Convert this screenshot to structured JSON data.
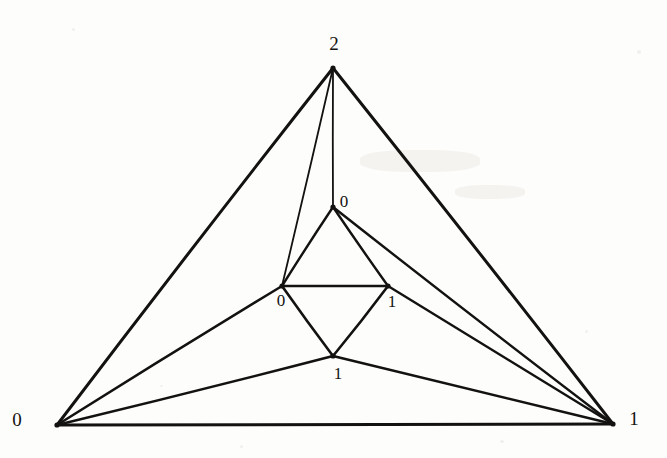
{
  "figure": {
    "type": "planar-graph-drawing",
    "background_color": "#fdfdfc",
    "ink_color": "#141210",
    "width": 667,
    "height": 458,
    "vertices": [
      {
        "id": "apex",
        "label": "2",
        "x": 333,
        "y": 68,
        "label_x": 334,
        "label_y": 43
      },
      {
        "id": "inner-top",
        "label": "0",
        "x": 333,
        "y": 207,
        "label_x": 344,
        "label_y": 201
      },
      {
        "id": "inner-left",
        "label": "0",
        "x": 282,
        "y": 286,
        "label_x": 281,
        "label_y": 300
      },
      {
        "id": "inner-right",
        "label": "1",
        "x": 388,
        "y": 286,
        "label_x": 392,
        "label_y": 301
      },
      {
        "id": "inner-bottom",
        "label": "1",
        "x": 333,
        "y": 356,
        "label_x": 338,
        "label_y": 373
      },
      {
        "id": "bottom-left",
        "label": "0",
        "x": 57,
        "y": 425,
        "label_x": 17,
        "label_y": 419
      },
      {
        "id": "bottom-right",
        "label": "1",
        "x": 613,
        "y": 424,
        "label_x": 634,
        "label_y": 418
      }
    ],
    "edges": [
      {
        "from": "bottom-left",
        "to": "apex",
        "weight": 3.0
      },
      {
        "from": "apex",
        "to": "bottom-right",
        "weight": 3.0
      },
      {
        "from": "bottom-left",
        "to": "bottom-right",
        "weight": 3.0
      },
      {
        "from": "apex",
        "to": "inner-left",
        "weight": 1.8
      },
      {
        "from": "apex",
        "to": "inner-top",
        "weight": 1.8
      },
      {
        "from": "inner-top",
        "to": "inner-left",
        "weight": 2.4
      },
      {
        "from": "inner-top",
        "to": "inner-right",
        "weight": 2.4
      },
      {
        "from": "inner-top",
        "to": "bottom-right",
        "weight": 2.4
      },
      {
        "from": "inner-left",
        "to": "inner-right",
        "weight": 2.6
      },
      {
        "from": "inner-left",
        "to": "inner-bottom",
        "weight": 2.6
      },
      {
        "from": "inner-right",
        "to": "inner-bottom",
        "weight": 2.6
      },
      {
        "from": "inner-right",
        "to": "bottom-right",
        "weight": 2.4
      },
      {
        "from": "inner-left",
        "to": "bottom-left",
        "weight": 2.6
      },
      {
        "from": "inner-bottom",
        "to": "bottom-left",
        "weight": 2.6
      },
      {
        "from": "inner-bottom",
        "to": "bottom-right",
        "weight": 2.6
      }
    ],
    "labels": [
      {
        "name": "label-apex-2",
        "text": "2",
        "x": 334,
        "y": 43,
        "size": "large"
      },
      {
        "name": "label-inner-top-0",
        "text": "0",
        "x": 344,
        "y": 201,
        "size": "small"
      },
      {
        "name": "label-inner-left-0",
        "text": "0",
        "x": 281,
        "y": 300,
        "size": "small"
      },
      {
        "name": "label-inner-right-1",
        "text": "1",
        "x": 392,
        "y": 301,
        "size": "small"
      },
      {
        "name": "label-inner-bottom-1",
        "text": "1",
        "x": 338,
        "y": 373,
        "size": "small"
      },
      {
        "name": "label-bottom-left-0",
        "text": "0",
        "x": 17,
        "y": 419,
        "size": "large"
      },
      {
        "name": "label-bottom-right-1",
        "text": "1",
        "x": 634,
        "y": 418,
        "size": "large"
      }
    ]
  }
}
